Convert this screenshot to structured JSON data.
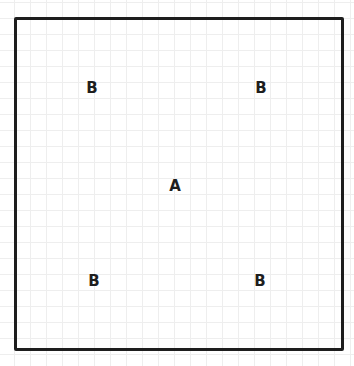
{
  "diagram": {
    "frame": {
      "label": ""
    },
    "labels": [
      {
        "text": "B",
        "x": 92,
        "y": 88
      },
      {
        "text": "B",
        "x": 261,
        "y": 88
      },
      {
        "text": "A",
        "x": 175,
        "y": 186
      },
      {
        "text": "B",
        "x": 94,
        "y": 281
      },
      {
        "text": "B",
        "x": 260,
        "y": 281
      }
    ]
  }
}
